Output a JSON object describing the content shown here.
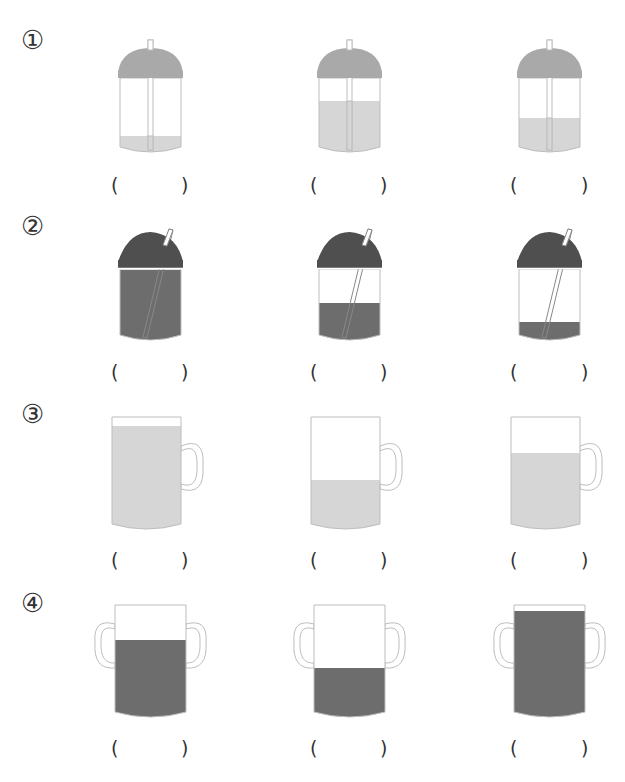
{
  "colors": {
    "light_liquid": "#d6d6d6",
    "light_lid": "#a9a9a9",
    "dark_liquid": "#6d6d6d",
    "dark_lid": "#4f4f4f",
    "outline": "#bdbdbd",
    "text": "#333333"
  },
  "questions": [
    {
      "label": "①",
      "type": "dome-cup-straight-straw",
      "items": [
        {
          "fill_top_y": 136,
          "answer_open": "(",
          "answer_close": ")"
        },
        {
          "fill_top_y": 101,
          "answer_open": "(",
          "answer_close": ")"
        },
        {
          "fill_top_y": 118,
          "answer_open": "(",
          "answer_close": ")"
        }
      ]
    },
    {
      "label": "②",
      "type": "dome-cup-slanted-straw",
      "items": [
        {
          "fill_top_y": 270,
          "answer_open": "(",
          "answer_close": ")"
        },
        {
          "fill_top_y": 303,
          "answer_open": "(",
          "answer_close": ")"
        },
        {
          "fill_top_y": 322,
          "answer_open": "(",
          "answer_close": ")"
        }
      ]
    },
    {
      "label": "③",
      "type": "mug-one-handle",
      "items": [
        {
          "fill_top_y": 426,
          "answer_open": "(",
          "answer_close": ")"
        },
        {
          "fill_top_y": 480,
          "answer_open": "(",
          "answer_close": ")"
        },
        {
          "fill_top_y": 453,
          "answer_open": "(",
          "answer_close": ")"
        }
      ]
    },
    {
      "label": "④",
      "type": "mug-two-handles",
      "items": [
        {
          "fill_top_y": 640,
          "answer_open": "(",
          "answer_close": ")"
        },
        {
          "fill_top_y": 668,
          "answer_open": "(",
          "answer_close": ")"
        },
        {
          "fill_top_y": 611,
          "answer_open": "(",
          "answer_close": ")"
        }
      ]
    }
  ]
}
